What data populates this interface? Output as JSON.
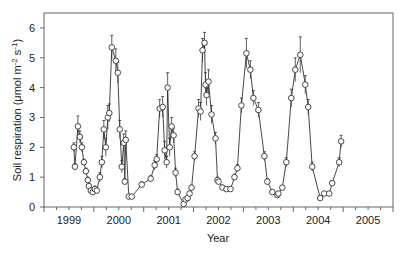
{
  "chart_data": {
    "type": "line",
    "title": "",
    "xlabel": "Year",
    "ylabel": "Soil respiration (μmol m-2 s-1)",
    "ylabel_parts": {
      "main": "Soil respiration (μmol m",
      "sup1": "-2",
      "mid": " s",
      "sup2": "-1",
      "end": ")"
    },
    "xlim": [
      1999,
      2006
    ],
    "ylim": [
      0,
      6.5
    ],
    "x_tick_labels": [
      "1999",
      "2000",
      "2001",
      "2002",
      "2003",
      "2004",
      "2005"
    ],
    "x_tick_label_positions": [
      1999.5,
      2000.5,
      2001.5,
      2002.5,
      2003.5,
      2004.5,
      2005.5
    ],
    "x_major_ticks": [
      1999,
      2000,
      2001,
      2002,
      2003,
      2004,
      2005,
      2006
    ],
    "y_ticks": [
      0,
      1,
      2,
      3,
      4,
      5,
      6
    ],
    "grid": false,
    "legend": null,
    "marker": "open-circle",
    "error_bars": true,
    "series": [
      {
        "name": "Soil respiration",
        "x": [
          1999.6,
          1999.62,
          1999.68,
          1999.72,
          1999.76,
          1999.8,
          1999.84,
          1999.88,
          1999.9,
          1999.94,
          1999.98,
          2000.02,
          2000.06,
          2000.12,
          2000.16,
          2000.2,
          2000.24,
          2000.28,
          2000.31,
          2000.36,
          2000.44,
          2000.48,
          2000.52,
          2000.56,
          2000.6,
          2000.62,
          2000.64,
          2000.7,
          2000.76,
          2000.96,
          2001.14,
          2001.22,
          2001.26,
          2001.32,
          2001.38,
          2001.42,
          2001.46,
          2001.48,
          2001.52,
          2001.56,
          2001.6,
          2001.64,
          2001.68,
          2001.8,
          2001.84,
          2001.88,
          2001.92,
          2001.96,
          2002.02,
          2002.1,
          2002.14,
          2002.18,
          2002.22,
          2002.24,
          2002.26,
          2002.3,
          2002.36,
          2002.44,
          2002.48,
          2002.5,
          2002.58,
          2002.66,
          2002.74,
          2002.82,
          2002.88,
          2002.96,
          2003.06,
          2003.14,
          2003.2,
          2003.3,
          2003.42,
          2003.48,
          2003.58,
          2003.68,
          2003.7,
          2003.78,
          2003.86,
          2003.96,
          2004.04,
          2004.14,
          2004.24,
          2004.3,
          2004.38,
          2004.54,
          2004.62,
          2004.72,
          2004.78,
          2004.92,
          2004.96
        ],
        "y": [
          2.0,
          1.35,
          2.7,
          2.35,
          2.0,
          1.5,
          1.2,
          0.9,
          0.7,
          0.55,
          0.5,
          0.6,
          0.55,
          1.0,
          1.5,
          2.6,
          2.0,
          3.0,
          3.15,
          5.35,
          4.9,
          4.5,
          2.6,
          1.35,
          2.15,
          0.85,
          2.25,
          0.35,
          0.35,
          0.75,
          0.95,
          1.4,
          1.6,
          3.3,
          3.35,
          1.9,
          1.5,
          4.0,
          2.0,
          2.7,
          2.4,
          1.15,
          0.5,
          0.1,
          0.25,
          0.3,
          0.45,
          0.65,
          1.7,
          3.3,
          3.2,
          5.25,
          5.5,
          4.1,
          3.75,
          4.2,
          3.1,
          2.3,
          0.9,
          0.85,
          0.65,
          0.6,
          0.6,
          1.0,
          1.3,
          3.4,
          5.15,
          4.6,
          3.65,
          3.25,
          1.7,
          0.85,
          0.5,
          0.4,
          0.45,
          0.65,
          1.5,
          3.65,
          4.6,
          5.1,
          4.1,
          3.35,
          1.35,
          0.3,
          0.45,
          0.45,
          0.8,
          1.5,
          2.2
        ],
        "err": [
          0.15,
          0.1,
          0.35,
          0.2,
          0.15,
          0.1,
          0.1,
          0.1,
          0.08,
          0.08,
          0.08,
          0.1,
          0.08,
          0.15,
          0.2,
          0.3,
          0.3,
          0.4,
          0.3,
          0.4,
          0.4,
          0.35,
          0.3,
          0.2,
          0.3,
          0.1,
          0.3,
          0.05,
          0.05,
          0.1,
          0.1,
          0.15,
          0.15,
          0.3,
          0.35,
          0.3,
          0.2,
          0.5,
          0.3,
          0.3,
          0.25,
          0.15,
          0.1,
          0.05,
          0.05,
          0.05,
          0.05,
          0.08,
          0.15,
          0.3,
          0.3,
          0.4,
          0.35,
          0.4,
          0.35,
          0.4,
          0.3,
          0.2,
          0.1,
          0.1,
          0.08,
          0.08,
          0.08,
          0.1,
          0.12,
          0.25,
          0.5,
          0.3,
          0.25,
          0.25,
          0.15,
          0.1,
          0.05,
          0.05,
          0.05,
          0.05,
          0.15,
          0.3,
          0.4,
          0.6,
          0.3,
          0.25,
          0.15,
          0.05,
          0.05,
          0.05,
          0.08,
          0.15,
          0.2
        ]
      }
    ]
  },
  "colors": {
    "line": "#333333",
    "axis": "#666666",
    "marker_fill": "#ffffff",
    "marker_stroke": "#333333",
    "text": "#222222"
  }
}
